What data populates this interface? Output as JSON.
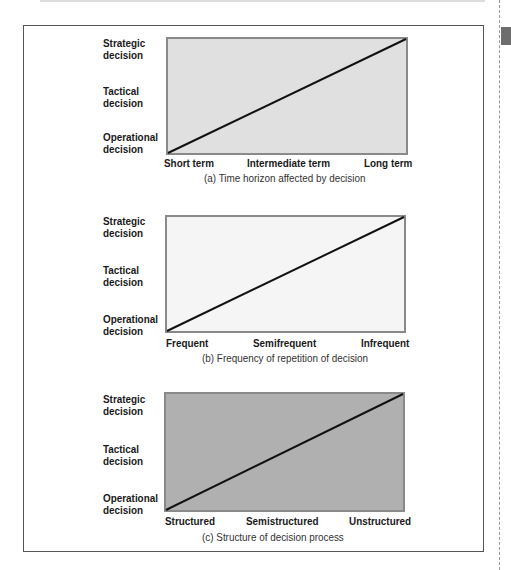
{
  "y_levels": [
    {
      "label": "Strategic\ndecision"
    },
    {
      "label": "Tactical\ndecision"
    },
    {
      "label": "Operational\ndecision"
    }
  ],
  "panels": [
    {
      "id": "a",
      "fill": "#e0e0e0",
      "x_labels": [
        "Short term",
        "Intermediate term",
        "Long term"
      ],
      "caption": "(a)  Time horizon affected by decision"
    },
    {
      "id": "b",
      "fill": "#f5f5f5",
      "x_labels": [
        "Frequent",
        "Semifrequent",
        "Infrequent"
      ],
      "caption": "(b)  Frequency of repetition of decision"
    },
    {
      "id": "c",
      "fill": "#b0b0b0",
      "x_labels": [
        "Structured",
        "Semistructured",
        "Unstructured"
      ],
      "caption": "(c)  Structure of decision process"
    }
  ],
  "colors": {
    "frame_border": "#555555",
    "box_border": "#8a8a8a",
    "line": "#111111",
    "side_tab": "#6d6d6d"
  }
}
